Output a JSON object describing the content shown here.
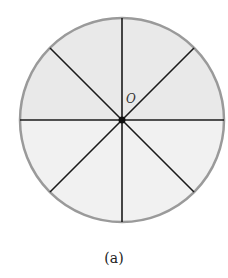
{
  "diagram": {
    "center_label": "O",
    "caption": "(a)",
    "sectors": 8,
    "colors": {
      "fill_top": "#e9e9e9",
      "fill_bottom": "#f1f1f1",
      "outline": "#9a9a9a",
      "spokes": "#1a1a1a"
    }
  }
}
